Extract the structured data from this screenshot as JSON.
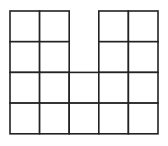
{
  "diagram": {
    "type": "grid-shape",
    "colors": {
      "line": "#222222",
      "fill": "#ffffff",
      "background": "#ffffff"
    },
    "columns": 5,
    "rows": 4,
    "origin": {
      "x": 10,
      "y": 11
    },
    "cell_width": 29.6,
    "cell_height": 30.7,
    "stroke_width": 1.6,
    "cells": [
      {
        "row": 0,
        "col": 0
      },
      {
        "row": 0,
        "col": 1
      },
      {
        "row": 0,
        "col": 3
      },
      {
        "row": 0,
        "col": 4
      },
      {
        "row": 1,
        "col": 0
      },
      {
        "row": 1,
        "col": 1
      },
      {
        "row": 1,
        "col": 3
      },
      {
        "row": 1,
        "col": 4
      },
      {
        "row": 2,
        "col": 0
      },
      {
        "row": 2,
        "col": 1
      },
      {
        "row": 2,
        "col": 2
      },
      {
        "row": 2,
        "col": 3
      },
      {
        "row": 2,
        "col": 4
      },
      {
        "row": 3,
        "col": 0
      },
      {
        "row": 3,
        "col": 1
      },
      {
        "row": 3,
        "col": 2
      },
      {
        "row": 3,
        "col": 3
      },
      {
        "row": 3,
        "col": 4
      }
    ],
    "cell_count": 18
  }
}
